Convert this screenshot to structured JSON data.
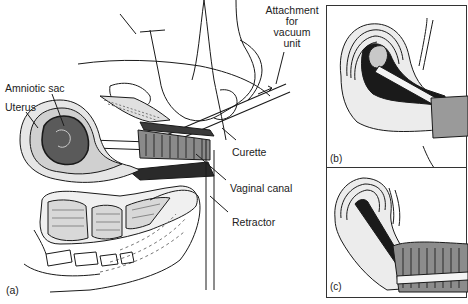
{
  "figure": {
    "panels": [
      {
        "id": "a",
        "label": "(a)"
      },
      {
        "id": "b",
        "label": "(b)"
      },
      {
        "id": "c",
        "label": "(c)"
      }
    ],
    "labels": {
      "amniotic_sac": "Amniotic sac",
      "uterus": "Uterus",
      "attachment_line1": "Attachment",
      "attachment_line2": "for",
      "attachment_line3": "vacuum",
      "attachment_line4": "unit",
      "curette": "Curette",
      "vaginal_canal": "Vaginal canal",
      "retractor": "Retractor"
    },
    "colors": {
      "ink": "#1a1a1a",
      "shade": "#555555",
      "light_shade": "#bdbdbd",
      "background": "#ffffff"
    }
  }
}
